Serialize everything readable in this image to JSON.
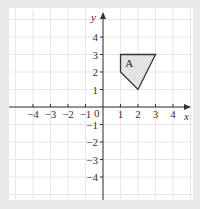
{
  "figure": {
    "background": "#e9e9e9",
    "panel_color": "#ffffff",
    "grid_color": "#e6e6e6",
    "axis_color": "#333333",
    "shape_fill": "#e3e3e3",
    "shape_stroke": "#333333"
  },
  "axes": {
    "x_label": "x",
    "y_label": "y",
    "origin_label": "0",
    "x_ticks": [
      {
        "value": -4,
        "label": "−4"
      },
      {
        "value": -3,
        "label": "−3"
      },
      {
        "value": -2,
        "label": "−2"
      },
      {
        "value": -1,
        "label": "−1"
      },
      {
        "value": 1,
        "label": "1"
      },
      {
        "value": 2,
        "label": "2"
      },
      {
        "value": 3,
        "label": "3"
      },
      {
        "value": 4,
        "label": "4"
      }
    ],
    "y_ticks": [
      {
        "value": 4,
        "label": "4"
      },
      {
        "value": 3,
        "label": "3"
      },
      {
        "value": 2,
        "label": "2"
      },
      {
        "value": 1,
        "label": "1"
      },
      {
        "value": -1,
        "label": "−1"
      },
      {
        "value": -2,
        "label": "−2"
      },
      {
        "value": -3,
        "label": "−3"
      },
      {
        "value": -4,
        "label": "−4"
      }
    ]
  },
  "shape": {
    "label": "A",
    "vertices": [
      [
        1,
        3
      ],
      [
        3,
        3
      ],
      [
        2,
        1
      ],
      [
        1,
        2
      ]
    ],
    "label_position": [
      1.5,
      2.5
    ]
  }
}
